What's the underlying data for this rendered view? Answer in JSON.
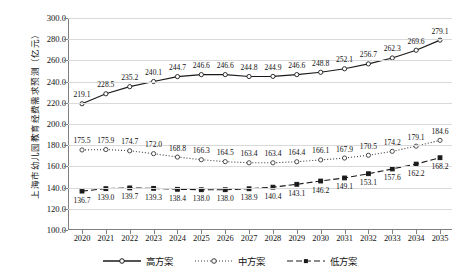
{
  "chart_data": {
    "type": "line",
    "title": "",
    "xlabel": "",
    "ylabel": "上海市幼儿园教育经费需求预测（亿元）",
    "ylim": [
      100.0,
      300.0
    ],
    "ytick_step": 20.0,
    "grid": true,
    "legend_position": "bottom",
    "categories": [
      "2020",
      "2021",
      "2022",
      "2023",
      "2024",
      "2025",
      "2026",
      "2027",
      "2028",
      "2029",
      "2030",
      "2031",
      "2032",
      "2033",
      "2034",
      "2035"
    ],
    "yticks": [
      "100.0",
      "120.0",
      "140.0",
      "160.0",
      "180.0",
      "200.0",
      "220.0",
      "240.0",
      "260.0",
      "280.0",
      "300.0"
    ],
    "series": [
      {
        "name": "高方案",
        "style": "solid",
        "marker": "open-circle",
        "color": "#1a1a1a",
        "values": [
          219.1,
          228.5,
          235.2,
          240.1,
          244.7,
          246.6,
          246.6,
          244.8,
          244.9,
          246.6,
          248.8,
          252.1,
          256.7,
          262.3,
          269.6,
          279.1
        ]
      },
      {
        "name": "中方案",
        "style": "dotted",
        "marker": "open-circle",
        "color": "#3a3a3a",
        "values": [
          175.5,
          175.9,
          174.7,
          172.0,
          168.8,
          166.3,
          164.5,
          163.4,
          163.4,
          164.4,
          166.1,
          167.9,
          170.5,
          174.2,
          179.1,
          184.6
        ]
      },
      {
        "name": "低方案",
        "style": "dashed",
        "marker": "filled-square",
        "color": "#1a1a1a",
        "values": [
          136.7,
          139.0,
          139.7,
          139.3,
          138.4,
          138.0,
          138.0,
          138.9,
          140.4,
          143.1,
          146.2,
          149.1,
          153.1,
          157.6,
          162.2,
          168.2
        ]
      }
    ]
  }
}
